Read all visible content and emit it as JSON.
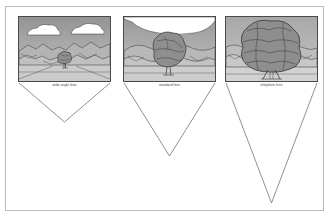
{
  "figure": {
    "title": "",
    "background_color": "#ffffff",
    "frame_color": "#b9b9b9"
  },
  "panels": [
    {
      "id": "wide-angle",
      "caption": "wide angle lens",
      "photo": {
        "x": 17,
        "y": 15,
        "width": 93,
        "height": 66,
        "sky_top_color": "#9b9b9b",
        "sky_bottom_color": "#c2c2c2",
        "ground_color": "#c9c9c9",
        "cloud_color": "#ffffff",
        "tree_canopy_color": "#8e8e8e",
        "clouds": 2,
        "tree_size": "small",
        "mountains": "wide range of distant hills"
      },
      "cone": {
        "top_width": 93,
        "apex_x": 46.5,
        "depth": 39,
        "label": "wide field of view",
        "stroke_color": "#6b6b6b"
      }
    },
    {
      "id": "standard",
      "caption": "standard lens",
      "photo": {
        "x": 122,
        "y": 15,
        "width": 93,
        "height": 66,
        "sky_top_color": "#9b9b9b",
        "sky_bottom_color": "#c2c2c2",
        "ground_color": "#c9c9c9",
        "cloud_color": "#ffffff",
        "tree_canopy_color": "#8e8e8e",
        "clouds": 1,
        "tree_size": "medium",
        "mountains": "two mid-distance hills"
      },
      "cone": {
        "top_width": 93,
        "apex_x": 46.5,
        "depth": 73,
        "label": "standard field of view",
        "stroke_color": "#6b6b6b"
      }
    },
    {
      "id": "telephoto",
      "caption": "telephoto lens",
      "photo": {
        "x": 224,
        "y": 15,
        "width": 93,
        "height": 66,
        "sky_top_color": "#aeaeae",
        "sky_bottom_color": "#c6c6c6",
        "ground_color": "#cfcfcf",
        "cloud_color": "#ffffff",
        "tree_canopy_color": "#8e8e8e",
        "clouds": 0,
        "tree_size": "large",
        "mountains": "narrow slice of low ridge"
      },
      "cone": {
        "top_width": 93,
        "apex_x": 46.5,
        "depth": 120,
        "label": "narrow field of view",
        "stroke_color": "#6b6b6b"
      }
    }
  ],
  "caption_style": {
    "font_size_px": 3.3,
    "color": "#3c3c3c"
  }
}
